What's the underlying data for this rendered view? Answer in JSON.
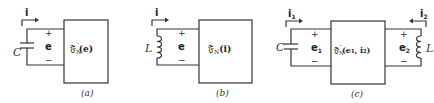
{
  "panels": [
    {
      "id": "a",
      "caption": "(a)",
      "element": "C",
      "element_type": "capacitor",
      "current": "i",
      "voltage": "e",
      "plus": "+",
      "minus": "−",
      "network_symbol": "𝔉",
      "network_sub": "N",
      "network_sup": "′",
      "network_arg": "(e)"
    },
    {
      "id": "b",
      "caption": "(b)",
      "element": "L",
      "element_type": "inductor",
      "current": "i",
      "voltage": "e",
      "plus": "+",
      "minus": "−",
      "network_symbol": "𝔉",
      "network_sub": "N",
      "network_sup": "",
      "network_arg": "(i)"
    },
    {
      "id": "c",
      "caption": "(c)",
      "left_element": "C",
      "right_element": "L",
      "current_1": "i",
      "current_1_sub": "1",
      "current_2": "i",
      "current_2_sub": "2",
      "voltage_1": "e",
      "voltage_1_sub": "1",
      "voltage_2": "e",
      "voltage_2_sub": "2",
      "plus": "+",
      "minus": "−",
      "network_symbol": "𝔉",
      "network_sub": "N",
      "network_sup": "″",
      "network_arg": "(e₁, i₂)"
    }
  ]
}
